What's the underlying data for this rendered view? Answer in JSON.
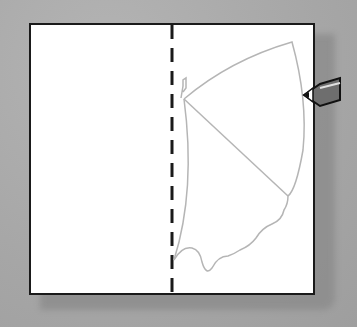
{
  "scene": {
    "description": "Folded paper with a half butterfly wing outline drawn along a dashed fold line, pencil at right edge",
    "colors": {
      "background": "#a9a9a9",
      "paper": "#ffffff",
      "paper_border": "#1a1a1a",
      "fold_line": "#1a1a1a",
      "outline": "#b0b0b0",
      "pencil_body": "#6e6e6e"
    }
  }
}
